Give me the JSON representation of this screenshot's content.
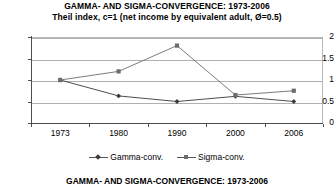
{
  "chart_data": {
    "type": "line",
    "title": "GAMMA- AND SIGMA-CONVERGENCE: 1973-2006",
    "subtitle": "Theil index, c=1 (net income by equivalent adult, Ø=0.5)",
    "xlabel": "",
    "ylabel": "",
    "categories": [
      "1973",
      "1980",
      "1990",
      "2000",
      "2006"
    ],
    "series": [
      {
        "name": "Gamma-conv.",
        "marker": "diamond",
        "color": "#3a3a3a",
        "values": [
          1.0,
          0.63,
          0.5,
          0.62,
          0.5
        ]
      },
      {
        "name": "Sigma-conv.",
        "marker": "square",
        "color": "#6d6d6d",
        "values": [
          1.0,
          1.2,
          1.8,
          0.65,
          0.75
        ]
      }
    ],
    "ylim": [
      0,
      2
    ],
    "yticks": [
      0,
      0.5,
      1,
      1.5,
      2
    ],
    "ytick_labels": [
      "0",
      "0.5",
      "1",
      "1.5",
      "2"
    ],
    "grid": true,
    "legend_position": "bottom"
  },
  "legend": {
    "entries": [
      {
        "label": "Gamma-conv."
      },
      {
        "label": "Sigma-conv."
      }
    ]
  },
  "next_chart_title_partial": "GAMMA- AND SIGMA-CONVERGENCE: 1973-2006"
}
